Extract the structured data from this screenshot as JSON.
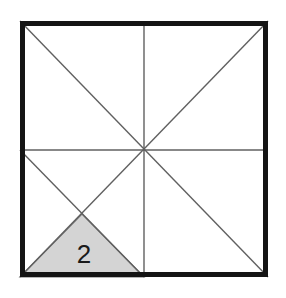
{
  "figure": {
    "type": "geometric-diagram",
    "canvas": {
      "width": 286,
      "height": 298,
      "background": "#ffffff"
    },
    "colors": {
      "border": "#141414",
      "line": "#606060",
      "shade_fill": "#d4d4d4",
      "shade_stroke": "#707070",
      "label_text": "#1a1a1a"
    },
    "square": {
      "name": "outer-square",
      "left": 20,
      "top": 21,
      "right": 268,
      "bottom": 277,
      "border_width": 5
    },
    "points": {
      "top_left": [
        20,
        21
      ],
      "top_right": [
        268,
        21
      ],
      "bottom_left": [
        20,
        277
      ],
      "bottom_right": [
        268,
        277
      ],
      "center": [
        144,
        150
      ],
      "top_mid": [
        144,
        21
      ],
      "bottom_mid": [
        144,
        277
      ],
      "left_mid": [
        20,
        150
      ],
      "right_mid": [
        268,
        150
      ],
      "quadrant_cross": [
        82,
        214
      ]
    },
    "lines": [
      {
        "name": "main-diagonal",
        "from": [
          20,
          21
        ],
        "to": [
          268,
          277
        ]
      },
      {
        "name": "anti-diagonal",
        "from": [
          20,
          277
        ],
        "to": [
          268,
          21
        ]
      },
      {
        "name": "vertical-midline",
        "from": [
          144,
          21
        ],
        "to": [
          144,
          277
        ]
      },
      {
        "name": "horizontal-midline",
        "from": [
          20,
          150
        ],
        "to": [
          268,
          150
        ]
      },
      {
        "name": "lower-left-sub-diagonal",
        "from": [
          20,
          150
        ],
        "to": [
          144,
          277
        ]
      }
    ],
    "shaded_region": {
      "name": "shaded-triangle",
      "label": "2",
      "vertices": [
        [
          20,
          277
        ],
        [
          82,
          214
        ],
        [
          144,
          277
        ]
      ],
      "label_position": [
        84,
        256
      ]
    }
  }
}
